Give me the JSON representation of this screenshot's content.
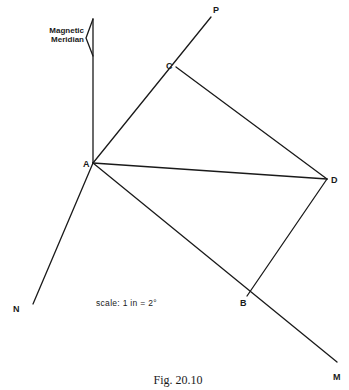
{
  "figure": {
    "caption": "Fig. 20.10",
    "scale_label": "scale: 1 in = 2°",
    "meridian_label_line1": "Magnetic",
    "meridian_label_line2": "Meridian",
    "points": {
      "A": {
        "label": "A",
        "x": 93,
        "y": 163
      },
      "B": {
        "label": "B",
        "x": 247,
        "y": 296
      },
      "C": {
        "label": "C",
        "x": 176,
        "y": 67
      },
      "D": {
        "label": "D",
        "x": 327,
        "y": 179
      },
      "P": {
        "label": "P",
        "x": 211,
        "y": 17
      },
      "M": {
        "label": "M",
        "x": 337,
        "y": 362
      },
      "N": {
        "label": "N",
        "x": 33,
        "y": 304
      }
    },
    "lines": [
      {
        "from": "A",
        "to": "P",
        "name": "line-AP"
      },
      {
        "from": "A",
        "to": "M",
        "name": "line-AM"
      },
      {
        "from": "A",
        "to": "N",
        "name": "line-AN"
      },
      {
        "from": "A",
        "to": "D",
        "name": "line-AD"
      },
      {
        "from": "C",
        "to": "D",
        "name": "line-CD"
      },
      {
        "from": "D",
        "to": "B",
        "name": "line-DB"
      },
      {
        "from": "A",
        "to": "meridian-top",
        "name": "magnetic-meridian-line"
      }
    ],
    "colors": {
      "ink": "#1a1a1a",
      "background": "#ffffff"
    }
  }
}
